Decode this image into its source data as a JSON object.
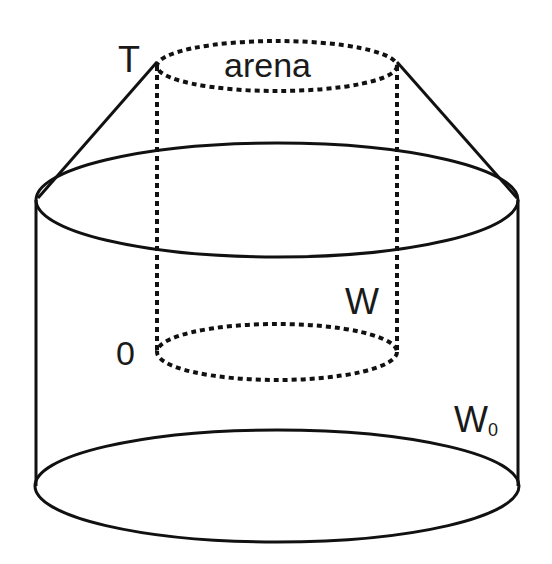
{
  "diagram": {
    "labels": {
      "top_left": "T",
      "arena": "arena",
      "inner_bottom_left": "0",
      "inner_right": "W",
      "outer_right_main": "W",
      "outer_right_sub": "0"
    },
    "shapes": {
      "outer_cylinder": {
        "style": "solid",
        "top_ellipse": {
          "cx": 277,
          "cy": 200,
          "rx": 241,
          "ry": 57
        },
        "bottom_ellipse": {
          "cx": 277,
          "cy": 486,
          "rx": 242,
          "ry": 56
        }
      },
      "inner_cylinder": {
        "style": "dotted",
        "top_ellipse": {
          "cx": 277,
          "cy": 66,
          "rx": 120,
          "ry": 25
        },
        "bottom_ellipse": {
          "cx": 277,
          "cy": 352,
          "rx": 120,
          "ry": 28
        }
      },
      "cone_lines": {
        "style": "solid",
        "left": [
          [
            157,
            62
          ],
          [
            38,
            198
          ]
        ],
        "right": [
          [
            397,
            62
          ],
          [
            517,
            198
          ]
        ]
      }
    },
    "colors": {
      "stroke": "#111111",
      "background": "#ffffff",
      "text": "#1a1a1a"
    }
  }
}
